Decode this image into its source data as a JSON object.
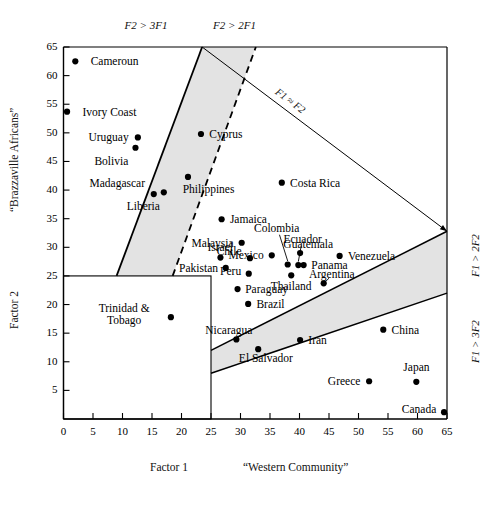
{
  "chart_data": {
    "type": "scatter",
    "title": "",
    "xlabel": "Factor 1",
    "xlabel2": "“Western Community”",
    "ylabel": "Factor 2",
    "ylabel2": "“Brazzaville Africans”",
    "xlim": [
      0,
      65
    ],
    "ylim": [
      0,
      65
    ],
    "xticks": [
      0,
      5,
      10,
      15,
      20,
      25,
      30,
      35,
      40,
      45,
      50,
      55,
      60,
      65
    ],
    "yticks": [
      5,
      10,
      15,
      20,
      25,
      30,
      35,
      40,
      45,
      50,
      55,
      60,
      65
    ],
    "grid": false,
    "legend": "none",
    "points": [
      {
        "label": "Cameroun",
        "x": 2.0,
        "y": 62.5,
        "lx": 4.6,
        "ly": 62.5,
        "anchor": "left"
      },
      {
        "label": "Ivory Coast",
        "x": 0.6,
        "y": 53.7,
        "lx": 3.2,
        "ly": 53.7,
        "anchor": "left"
      },
      {
        "label": "Uruguay",
        "x": 12.6,
        "y": 49.2,
        "lx": 11.0,
        "ly": 49.2,
        "anchor": "right"
      },
      {
        "label": "Bolivia",
        "x": 12.2,
        "y": 47.4,
        "lx": 11.0,
        "ly": 45.0,
        "anchor": "right"
      },
      {
        "label": "Madagascar",
        "x": 15.3,
        "y": 39.3,
        "lx": 13.9,
        "ly": 41.2,
        "anchor": "right"
      },
      {
        "label": "Liberia",
        "x": 17.0,
        "y": 39.6,
        "lx": 16.3,
        "ly": 37.2,
        "anchor": "right"
      },
      {
        "label": "Cyprus",
        "x": 23.3,
        "y": 49.8,
        "lx": 24.7,
        "ly": 49.8,
        "anchor": "left"
      },
      {
        "label": "Philippines",
        "x": 21.1,
        "y": 42.3,
        "lx": 20.2,
        "ly": 40.2,
        "anchor": "left"
      },
      {
        "label": "Jamaica",
        "x": 26.8,
        "y": 34.9,
        "lx": 28.2,
        "ly": 34.9,
        "anchor": "left"
      },
      {
        "label": "Malaysia",
        "x": 30.2,
        "y": 30.8,
        "lx": 28.8,
        "ly": 30.8,
        "anchor": "right"
      },
      {
        "label": "Israel",
        "x": 26.6,
        "y": 28.2,
        "lx": 26.6,
        "ly": 30.1,
        "anchor": "center"
      },
      {
        "label": "Chile",
        "x": 31.6,
        "y": 28.1,
        "lx": 30.2,
        "ly": 29.4,
        "anchor": "right"
      },
      {
        "label": "Pakistan",
        "x": 27.5,
        "y": 26.4,
        "lx": 26.2,
        "ly": 26.4,
        "anchor": "right"
      },
      {
        "label": "Peru",
        "x": 31.4,
        "y": 25.4,
        "lx": 30.1,
        "ly": 25.8,
        "anchor": "right"
      },
      {
        "label": "Paraguay",
        "x": 29.5,
        "y": 22.7,
        "lx": 30.8,
        "ly": 22.7,
        "anchor": "left"
      },
      {
        "label": "Brazil",
        "x": 31.3,
        "y": 20.1,
        "lx": 32.7,
        "ly": 20.1,
        "anchor": "left"
      },
      {
        "label": "Mexico",
        "x": 35.3,
        "y": 28.6,
        "lx": 33.9,
        "ly": 28.6,
        "anchor": "right"
      },
      {
        "label": "Colombia",
        "x": 38.0,
        "y": 27.0,
        "lx": 36.1,
        "ly": 33.3,
        "anchor": "center"
      },
      {
        "label": "Ecuador",
        "x": 39.8,
        "y": 26.9,
        "lx": 40.5,
        "ly": 31.4,
        "anchor": "center"
      },
      {
        "label": "Guatemala",
        "x": 40.1,
        "y": 29.0,
        "lx": 41.5,
        "ly": 30.5,
        "anchor": "center"
      },
      {
        "label": "Panama",
        "x": 40.7,
        "y": 26.9,
        "lx": 42.0,
        "ly": 26.9,
        "anchor": "left"
      },
      {
        "label": "Thailand",
        "x": 38.6,
        "y": 25.1,
        "lx": 38.6,
        "ly": 23.3,
        "anchor": "center"
      },
      {
        "label": "Costa Rica",
        "x": 37.0,
        "y": 41.3,
        "lx": 38.4,
        "ly": 41.3,
        "anchor": "left"
      },
      {
        "label": "Venezuela",
        "x": 46.8,
        "y": 28.5,
        "lx": 48.2,
        "ly": 28.5,
        "anchor": "left"
      },
      {
        "label": "Argentina",
        "x": 44.1,
        "y": 23.7,
        "lx": 45.5,
        "ly": 25.4,
        "anchor": "center"
      },
      {
        "label": "Nicaragua",
        "x": 29.3,
        "y": 13.9,
        "lx": 28.0,
        "ly": 15.6,
        "anchor": "center"
      },
      {
        "label": "El Salvador",
        "x": 33.0,
        "y": 12.2,
        "lx": 34.3,
        "ly": 10.7,
        "anchor": "center"
      },
      {
        "label": "Iran",
        "x": 40.1,
        "y": 13.8,
        "lx": 41.5,
        "ly": 13.8,
        "anchor": "left"
      },
      {
        "label": "China",
        "x": 54.2,
        "y": 15.6,
        "lx": 55.6,
        "ly": 15.6,
        "anchor": "left"
      },
      {
        "label": "Greece",
        "x": 51.8,
        "y": 6.6,
        "lx": 50.4,
        "ly": 6.6,
        "anchor": "right"
      },
      {
        "label": "Japan",
        "x": 59.8,
        "y": 6.5,
        "lx": 59.8,
        "ly": 9.0,
        "anchor": "center"
      },
      {
        "label": "Canada",
        "x": 64.5,
        "y": 1.2,
        "lx": 63.1,
        "ly": 1.8,
        "anchor": "right"
      },
      {
        "label": "Trinidad &\nTobago",
        "x": 18.2,
        "y": 17.8,
        "lx": 14.6,
        "ly": 18.4,
        "anchor": "right"
      }
    ],
    "leaders": [
      {
        "from_x": 36.6,
        "from_y": 32.2,
        "to_x": 38.0,
        "to_y": 27.6
      },
      {
        "from_x": 40.3,
        "from_y": 30.3,
        "to_x": 39.8,
        "to_y": 27.5
      },
      {
        "from_x": 45.0,
        "from_y": 24.6,
        "to_x": 44.3,
        "to_y": 23.9
      }
    ],
    "region_labels_top": [
      {
        "text": "F2 > 3F1",
        "x": 14.0
      },
      {
        "text": "F2 > 2F1",
        "x": 29.0
      }
    ],
    "region_labels_right": [
      {
        "text": "F1 > 2F2",
        "y": 28.5
      },
      {
        "text": "F1 > 3F2",
        "y": 13.5
      }
    ],
    "diagonal_label": "F1 ≈ F2",
    "bands": {
      "upper": {
        "solid_line": [
          [
            9.0,
            25.0
          ],
          [
            23.5,
            65.0
          ]
        ],
        "dashed_line": [
          [
            18.5,
            25.0
          ],
          [
            32.6,
            65.0
          ]
        ],
        "fill": "#e3e3e3"
      },
      "lower": {
        "upper_line": [
          [
            25.0,
            12.0
          ],
          [
            65.0,
            32.8
          ]
        ],
        "lower_line": [
          [
            25.0,
            8.0
          ],
          [
            65.0,
            22.0
          ]
        ],
        "fill": "#e3e3e3"
      },
      "diagonal_line": [
        [
          23.5,
          65.0
        ],
        [
          65.0,
          32.8
        ]
      ]
    },
    "inset_box": {
      "x0": 0,
      "y0": 0,
      "x1": 25.0,
      "y1": 25.0
    }
  }
}
